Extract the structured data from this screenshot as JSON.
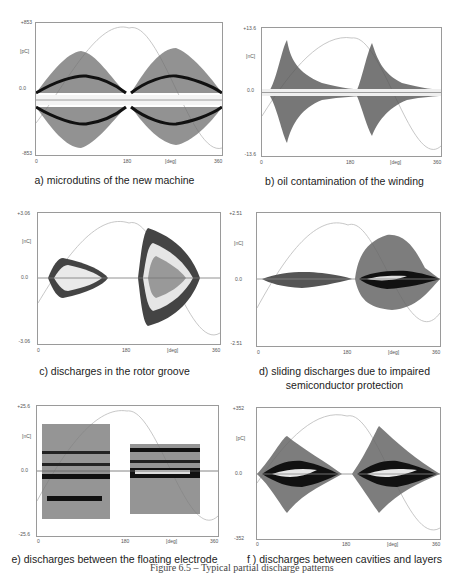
{
  "figure_caption": "Figure 6.5 – Typical partial discharge patterns",
  "x_axis": {
    "ticks": [
      "0",
      "180",
      "360"
    ],
    "unit_label": "[deg]"
  },
  "panels": [
    {
      "id": "a",
      "caption": "a) microdutins of the new machine",
      "y_max": "+853",
      "y_zero": "0.0",
      "y_min": "-853",
      "y_unit": "[pC]"
    },
    {
      "id": "b",
      "caption": "b) oil contamination of the winding",
      "y_max": "+13.6",
      "y_zero": "0.0",
      "y_min": "-13.6",
      "y_unit": "[nC]"
    },
    {
      "id": "c",
      "caption": "c) discharges in the rotor groove",
      "y_max": "+3.06",
      "y_zero": "0.0",
      "y_min": "-3.06",
      "y_unit": "[nC]"
    },
    {
      "id": "d",
      "caption": "d) sliding discharges due to impaired semiconductor protection",
      "caption_line1": "d) sliding discharges due to impaired",
      "caption_line2": "semiconductor protection",
      "y_max": "+2.51",
      "y_zero": "0.0",
      "y_min": "-2.51",
      "y_unit": "[nC]"
    },
    {
      "id": "e",
      "caption": "e) discharges between the floating electrode",
      "y_max": "+25.6",
      "y_zero": "0.0",
      "y_min": "-25.6",
      "y_unit": "[nC]"
    },
    {
      "id": "f",
      "caption": "f ) discharges between cavities and layers",
      "y_max": "+352",
      "y_zero": "0.0",
      "y_min": "-352",
      "y_unit": "[pC]"
    }
  ],
  "colors": {
    "scatter": "#3a3a3a",
    "core": "#111111",
    "sine": "#b0b0b0",
    "frame": "#9a9a9a"
  }
}
